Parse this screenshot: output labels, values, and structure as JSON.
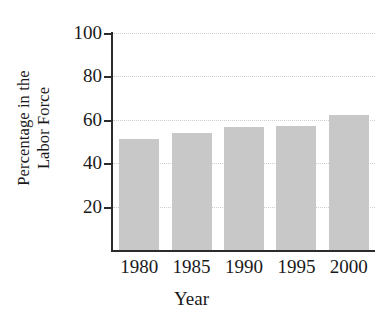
{
  "chart_data": {
    "type": "bar",
    "title": "",
    "subtitle": "",
    "xlabel": "Year",
    "ylabel": "Percentage in the Labor Force",
    "ylabel_lines": [
      "Percentage in the",
      "Labor Force"
    ],
    "categories": [
      "1980",
      "1985",
      "1990",
      "1995",
      "2000"
    ],
    "values": [
      51,
      54,
      56.5,
      57,
      62
    ],
    "ylim": [
      0,
      100
    ],
    "xlim_categories": 5,
    "ytick_labels": [
      "20",
      "40",
      "60",
      "80",
      "100"
    ],
    "ytick_values": [
      20,
      40,
      60,
      80,
      100
    ],
    "grid": true,
    "grid_style": "dotted",
    "grid_axis": "y",
    "legend": false,
    "legend_position": "none",
    "bar_color": "#c8c8c8",
    "axis_color": "#2b2b2b",
    "grid_color": "#cfcfcf",
    "background_color": "#ffffff"
  }
}
